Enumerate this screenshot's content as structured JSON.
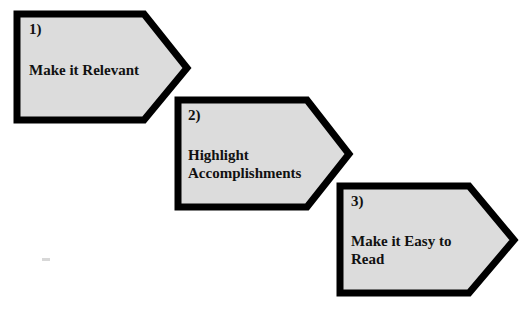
{
  "steps": [
    {
      "number": "1)",
      "title_line1": "Make it Relevant",
      "title_line2": ""
    },
    {
      "number": "2)",
      "title_line1": "Highlight",
      "title_line2": "Accomplishments"
    },
    {
      "number": "3)",
      "title_line1": "Make it Easy to",
      "title_line2": "Read"
    }
  ],
  "colors": {
    "fill": "#dcdcdc",
    "border": "#000000",
    "text": "#111111"
  }
}
